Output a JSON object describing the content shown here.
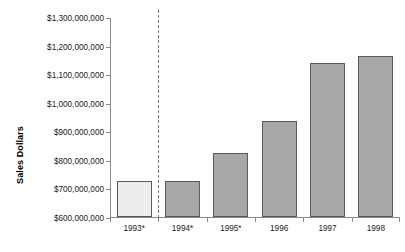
{
  "chart_data": {
    "type": "bar",
    "title": "",
    "xlabel": "",
    "ylabel": "Sales Dollars",
    "categories": [
      "1993*",
      "1994*",
      "1995*",
      "1996",
      "1997",
      "1998"
    ],
    "values": [
      725000000,
      727000000,
      825000000,
      935000000,
      1140000000,
      1162000000
    ],
    "ylim": [
      600000000,
      1300000000
    ],
    "ytick_values": [
      600000000,
      700000000,
      800000000,
      900000000,
      1000000000,
      1100000000,
      1200000000,
      1300000000
    ],
    "ytick_labels": [
      "$600,000,000",
      "$700,000,000",
      "$800,000,000",
      "$900,000,000",
      "$1,000,000,000",
      "$1,100,000,000",
      "$1,200,000,000",
      "$1,300,000,000"
    ],
    "grid": false,
    "legend": null,
    "bar_colors": [
      "#ededed",
      "#a8a8a8",
      "#a8a8a8",
      "#a8a8a8",
      "#a8a8a8",
      "#a8a8a8"
    ],
    "bar_border_color": "#5a5a5a",
    "annotations": [
      {
        "type": "vertical-dashed-line",
        "after_category": "1993*",
        "style": "dashed",
        "color": "#777777"
      }
    ],
    "background_color": "#ffffff",
    "axis_color": "#8a8a8a"
  }
}
